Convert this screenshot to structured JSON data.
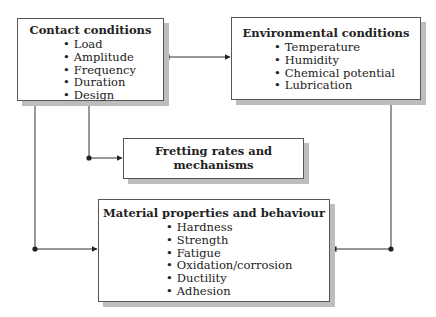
{
  "diagram": {
    "contact": {
      "title": "Contact conditions",
      "items": [
        "Load",
        "Amplitude",
        "Frequency",
        "Duration",
        "Design"
      ]
    },
    "environmental": {
      "title": "Environmental conditions",
      "items": [
        "Temperature",
        "Humidity",
        "Chemical potential",
        "Lubrication"
      ]
    },
    "fretting": {
      "title_line1": "Fretting rates and",
      "title_line2": "mechanisms"
    },
    "material": {
      "title": "Material properties and behaviour",
      "items": [
        "Hardness",
        "Strength",
        "Fatigue",
        "Oxidation/corrosion",
        "Ductility",
        "Adhesion"
      ]
    }
  }
}
